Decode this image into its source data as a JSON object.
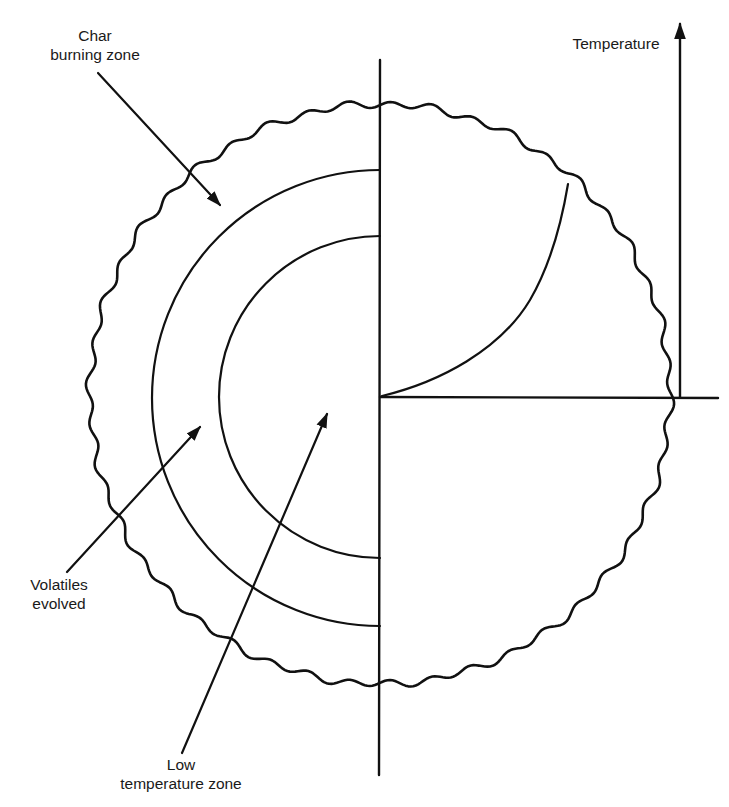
{
  "diagram": {
    "type": "cross-section of burning fuel particle with temperature profile",
    "stroke_color": "#111111",
    "background_color": "#ffffff",
    "labels": {
      "char_zone": {
        "line1": "Char",
        "line2": "burning zone"
      },
      "temperature_axis": {
        "text": "Temperature"
      },
      "volatiles": {
        "line1": "Volatiles",
        "line2": "evolved"
      },
      "low_temp_zone": {
        "line1": "Low",
        "line2": "temperature zone"
      }
    },
    "elements": [
      "wavy-outer-boundary",
      "char-burning-zone-arc",
      "low-temperature-zone-arc",
      "vertical-centerline",
      "horizontal-radius-line",
      "temperature-axis-arrow",
      "temperature-profile-curve"
    ]
  }
}
